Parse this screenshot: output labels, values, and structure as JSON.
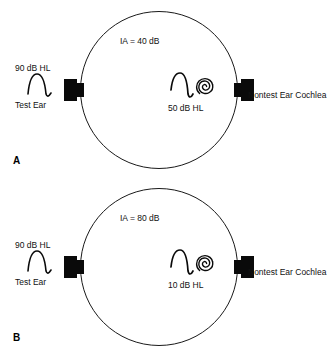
{
  "figure": {
    "type": "audiology-cross-hearing-diagram",
    "line_color": "#1a1a1a",
    "fill_color": "#0a0a0a",
    "background": "#ffffff"
  },
  "panels": [
    {
      "letter": "A",
      "interaural_attenuation": "IA = 40 dB",
      "presentation_level": "90 dB HL",
      "test_ear_label": "Test Ear",
      "crossover_level": "50 dB HL",
      "nontest_label": "Nontest Ear Cochlea",
      "icons": {
        "left_transducer": "earphone-icon",
        "right_transducer": "earphone-icon",
        "signal_wave": "sine-wave-icon",
        "crossed_wave": "sine-wave-icon",
        "cochlea": "cochlea-spiral-icon"
      }
    },
    {
      "letter": "B",
      "interaural_attenuation": "IA = 80 dB",
      "presentation_level": "90 dB HL",
      "test_ear_label": "Test Ear",
      "crossover_level": "10 dB HL",
      "nontest_label": "Nontest Ear Cochlea",
      "icons": {
        "left_transducer": "earphone-icon",
        "right_transducer": "earphone-icon",
        "signal_wave": "sine-wave-icon",
        "crossed_wave": "sine-wave-icon",
        "cochlea": "cochlea-spiral-icon"
      }
    }
  ]
}
